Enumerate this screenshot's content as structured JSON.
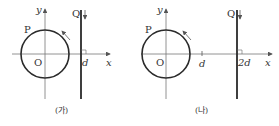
{
  "panels": [
    {
      "caption": "(가)",
      "circle_label": "P",
      "origin_label": "O",
      "wire_label": "Q",
      "x_axis_label": "x",
      "y_axis_label": "y",
      "tick_labels": [
        "d"
      ],
      "wire_position": "d",
      "current_direction": "down",
      "circle_rotation": "counterclockwise"
    },
    {
      "caption": "(나)",
      "circle_label": "P",
      "origin_label": "O",
      "wire_label": "Q",
      "x_axis_label": "x",
      "y_axis_label": "y",
      "tick_labels": [
        "d",
        "2d"
      ],
      "wire_position": "2d",
      "current_direction": "down",
      "circle_rotation": "counterclockwise"
    }
  ],
  "colors": {
    "stroke": "#2a2a2a",
    "axis": "#666666",
    "text": "#333333"
  }
}
